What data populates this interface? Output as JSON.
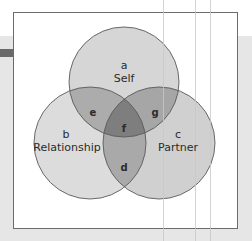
{
  "diagram": {
    "type": "venn",
    "sets": [
      {
        "letter": "a",
        "name": "Self"
      },
      {
        "letter": "b",
        "name": "Relationship"
      },
      {
        "letter": "c",
        "name": "Partner"
      }
    ],
    "intersections": [
      {
        "letter": "e",
        "between": [
          "Self",
          "Relationship"
        ]
      },
      {
        "letter": "g",
        "between": [
          "Self",
          "Partner"
        ]
      },
      {
        "letter": "d",
        "between": [
          "Relationship",
          "Partner"
        ]
      },
      {
        "letter": "f",
        "between": [
          "Self",
          "Relationship",
          "Partner"
        ]
      }
    ],
    "colors": {
      "single": "#d6d6d6",
      "double": "#a9a9a9",
      "triple": "#7e7e7e",
      "outline": "#5a5a5a",
      "frame": "#6b6b6b",
      "background": "#e6e6e6"
    }
  },
  "labels": {
    "a": "a",
    "self": "Self",
    "b": "b",
    "relationship": "Relationship",
    "c": "c",
    "partner": "Partner",
    "d": "d",
    "e": "e",
    "f": "f",
    "g": "g"
  }
}
